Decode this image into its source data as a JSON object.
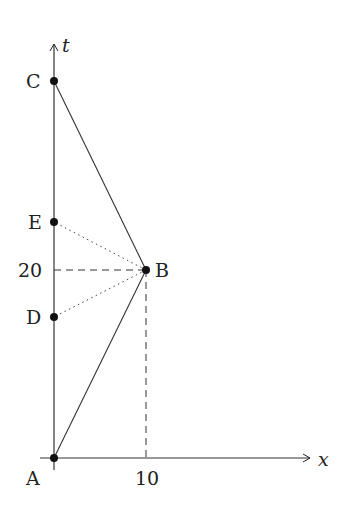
{
  "diagram": {
    "type": "spacetime-diagram",
    "axes": {
      "x_label": "x",
      "t_label": "t",
      "x_tick_label": "10",
      "t_tick_label": "20"
    },
    "points": [
      {
        "id": "A",
        "label": "A",
        "x": 0,
        "t": 0
      },
      {
        "id": "B",
        "label": "B",
        "x": 10,
        "t": 20
      },
      {
        "id": "C",
        "label": "C",
        "x": 0,
        "t": 40
      },
      {
        "id": "D",
        "label": "D",
        "x": 0,
        "t": 10
      },
      {
        "id": "E",
        "label": "E",
        "x": 0,
        "t": 30
      }
    ],
    "segments": [
      {
        "from": "A",
        "to": "B",
        "style": "solid"
      },
      {
        "from": "B",
        "to": "C",
        "style": "solid"
      },
      {
        "from": "B",
        "to": "E",
        "style": "dotted"
      },
      {
        "from": "B",
        "to": "D",
        "style": "dotted"
      },
      {
        "from": "B",
        "to": "t-axis@20",
        "style": "dashed"
      },
      {
        "from": "B",
        "to": "x-axis@10",
        "style": "dashed"
      }
    ],
    "colors": {
      "ink": "#222222",
      "background": "#ffffff"
    }
  }
}
